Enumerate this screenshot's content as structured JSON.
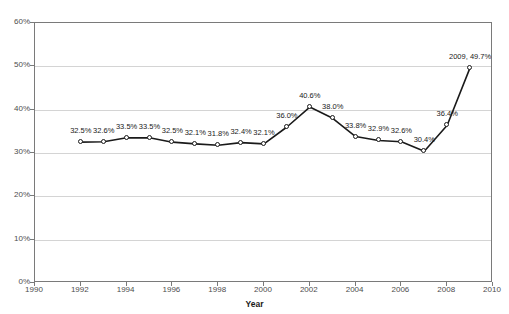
{
  "chart_data": {
    "type": "line",
    "title": "",
    "xlabel": "Year",
    "ylabel": "",
    "xlim": [
      1990,
      2010
    ],
    "ylim": [
      0,
      60
    ],
    "grid": true,
    "legend": "none",
    "xticks": [
      "1990",
      "1992",
      "1994",
      "1996",
      "1998",
      "2000",
      "2002",
      "2004",
      "2006",
      "2008",
      "2010"
    ],
    "xtick_values": [
      1990,
      1992,
      1994,
      1996,
      1998,
      2000,
      2002,
      2004,
      2006,
      2008,
      2010
    ],
    "yticks": [
      "0%",
      "10%",
      "20%",
      "30%",
      "40%",
      "50%",
      "60%"
    ],
    "ytick_values": [
      0,
      10,
      20,
      30,
      40,
      50,
      60
    ],
    "x": [
      1992,
      1993,
      1994,
      1995,
      1996,
      1997,
      1998,
      1999,
      2000,
      2001,
      2002,
      2003,
      2004,
      2005,
      2006,
      2007,
      2008,
      2009
    ],
    "values": [
      32.5,
      32.6,
      33.5,
      33.5,
      32.5,
      32.1,
      31.8,
      32.4,
      32.1,
      36.0,
      40.6,
      38.0,
      33.8,
      32.9,
      32.6,
      30.4,
      36.4,
      49.7
    ],
    "point_labels": [
      "32.5%",
      "32.6%",
      "33.5%",
      "33.5%",
      "32.5%",
      "32.1%",
      "31.8%",
      "32.4%",
      "32.1%",
      "36.0%",
      "40.6%",
      "38.0%",
      "33.8%",
      "32.9%",
      "32.6%",
      "30.4%",
      "36.4%",
      "2009, 49.7%"
    ],
    "series_color": "#1a1a1a",
    "marker_fill": "#ffffff",
    "grid_color": "#d4d4d4",
    "axis_color": "#7a7a7a"
  },
  "axis_title": {
    "x": "Year"
  },
  "faint_header": ""
}
